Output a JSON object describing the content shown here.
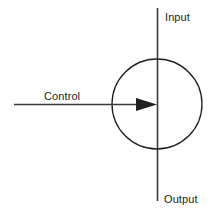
{
  "diagram": {
    "colors": {
      "line": "#3a3a3c",
      "circle": "#231f20",
      "text": "#231f20",
      "background": "#ffffff"
    },
    "labels": {
      "input": "Input",
      "output": "Output",
      "control": "Control"
    },
    "shapes": {
      "circle": {
        "name": "process-circle",
        "cx": 157,
        "cy": 104,
        "r": 45
      },
      "vertical_line": {
        "name": "input-output-axis",
        "x": 157.5,
        "y1": 8,
        "y2": 201
      },
      "horizontal_line": {
        "name": "control-arrow-line",
        "y": 104.5,
        "x1": 14,
        "x2": 139
      },
      "arrow_head": {
        "name": "control-arrow-head",
        "points": "137,98 157,104.5 137,111",
        "direction": "right"
      }
    },
    "text_positions": {
      "input": {
        "x": 165,
        "y": 21
      },
      "output": {
        "x": 164,
        "y": 203
      },
      "control": {
        "x": 44,
        "y": 100
      }
    }
  }
}
